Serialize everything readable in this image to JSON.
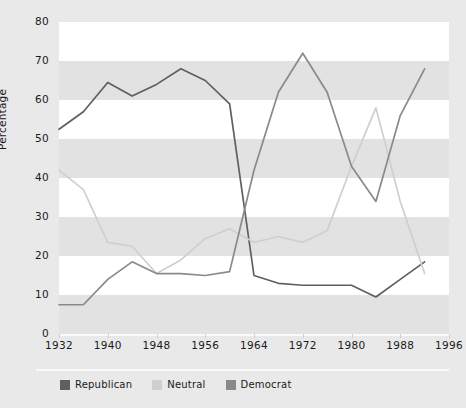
{
  "chart_data": {
    "type": "line",
    "title": "",
    "xlabel": "",
    "ylabel": "Percentage",
    "xlim": [
      1932,
      1996
    ],
    "ylim": [
      0,
      80
    ],
    "grid": "horizontal-banded",
    "legend_position": "bottom-left",
    "x_tick_labels": [
      "1932",
      "1940",
      "1948",
      "1956",
      "1964",
      "1972",
      "1980",
      "1988",
      "1996"
    ],
    "x_tick_values": [
      1932,
      1940,
      1948,
      1956,
      1964,
      1972,
      1980,
      1988,
      1996
    ],
    "y_tick_labels": [
      "0",
      "10",
      "20",
      "30",
      "40",
      "50",
      "60",
      "70",
      "80"
    ],
    "y_tick_values": [
      0,
      10,
      20,
      30,
      40,
      50,
      60,
      70,
      80
    ],
    "x": [
      1932,
      1936,
      1940,
      1944,
      1948,
      1952,
      1956,
      1960,
      1964,
      1968,
      1972,
      1976,
      1980,
      1984,
      1988,
      1992
    ],
    "series": [
      {
        "name": "Republican",
        "color": "#5f5f5f",
        "values": [
          52.5,
          57,
          64.5,
          61,
          64,
          68,
          65,
          59,
          15,
          13,
          12.5,
          12.5,
          12.5,
          9.5,
          14,
          18.5
        ]
      },
      {
        "name": "Neutral",
        "color": "#cfcfcf",
        "values": [
          42,
          37,
          23.5,
          22.5,
          15.5,
          19,
          24.5,
          27,
          23.5,
          25,
          23.5,
          26.5,
          43,
          58,
          34,
          15.5
        ]
      },
      {
        "name": "Democrat",
        "color": "#8a8a8a",
        "values": [
          7.5,
          7.5,
          14,
          18.5,
          15.5,
          15.5,
          15,
          16,
          42,
          62,
          72,
          62,
          43,
          34,
          56,
          68
        ]
      }
    ]
  },
  "legend": {
    "items": [
      {
        "label": "Republican",
        "color": "#5f5f5f"
      },
      {
        "label": "Neutral",
        "color": "#cfcfcf"
      },
      {
        "label": "Democrat",
        "color": "#8a8a8a"
      }
    ]
  },
  "axes": {
    "y_title": "Percentage"
  }
}
